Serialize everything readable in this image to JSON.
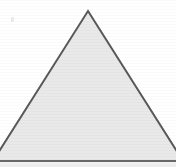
{
  "figure": {
    "canvas": {
      "width": 176,
      "height": 167,
      "background_color": "#ffffff"
    },
    "shape": {
      "name": "triangle",
      "type": "polygon",
      "sides": 3,
      "fill_color": "#e9e9e9",
      "stroke_color": "#595959",
      "stroke_width": 2,
      "texture": "horizontal-scanlines",
      "points": "88,11 183,161 -7,161",
      "vertices": [
        {
          "label": "apex",
          "x": 88,
          "y": 11
        },
        {
          "label": "bottom-right",
          "x": 183,
          "y": 161
        },
        {
          "label": "bottom-left",
          "x": -7,
          "y": 161
        }
      ]
    },
    "baseline": {
      "name": "base-line",
      "y": 161,
      "x1": 0,
      "x2": 176,
      "color": "#6e6e6e",
      "width": 1.5
    },
    "footer_strip": {
      "name": "bottom-strip",
      "y": 162.5,
      "height": 4.5,
      "color": "#efefef"
    }
  }
}
